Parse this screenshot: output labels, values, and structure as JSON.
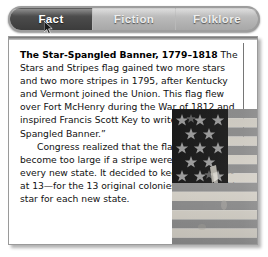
{
  "tabs": [
    {
      "label": "Fact",
      "active": true
    },
    {
      "label": "Fiction",
      "active": false
    },
    {
      "label": "Folklore",
      "active": false
    }
  ],
  "article": {
    "lead": "The Star-Spangled Banner, 1779–1818",
    "paragraph_1": " The Stars and Stripes flag gained two more stars and two more stripes in 1795, after Kentucky and Vermont joined the Union. This flag flew over Fort McHenry during the War of 1812 and inspired Francis Scott Key to write “The Star-Spangled Banner.”",
    "paragraph_2": "Congress realized that the flag would become too large if a stripe were added for every new state. It decided to keep the stripes at 13—for the 13 original colonies—and to add a star for each new state."
  },
  "figure": {
    "name": "star-spangled-banner-flag-photo",
    "stars": 15,
    "stripes": 15,
    "canton_stripe_rows": 5,
    "canton_star_columns": 3
  },
  "colors": {
    "tab_active_bg": "#4a4a4a",
    "tab_inactive_bg": "#b8b8b8",
    "tab_text": "#ffffff",
    "tabbar_frame": "#9d9d9d",
    "panel_bg": "#ffffff",
    "panel_border": "#9a9a9a",
    "body_text": "#111111",
    "column_rule": "#767676",
    "flag_canton": "#1b1b1b",
    "flag_stripe_dark": "#8f8f8f",
    "flag_stripe_light": "#d6d2c9",
    "flag_star": "#9b9b9b"
  },
  "cursor": {
    "name": "mouse-pointer"
  }
}
